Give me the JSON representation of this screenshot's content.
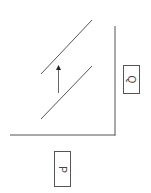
{
  "diagram": {
    "type": "shift-diagram-rotated",
    "axes": {
      "horizontal_axis": {
        "x1": 10,
        "y1": 135,
        "x2": 115,
        "y2": 135
      },
      "vertical_axis": {
        "x1": 115,
        "y1": 26,
        "x2": 115,
        "y2": 135
      }
    },
    "curves": [
      {
        "name": "upper-line",
        "x1": 41,
        "y1": 74,
        "x2": 92,
        "y2": 20
      },
      {
        "name": "lower-line",
        "x1": 41,
        "y1": 119,
        "x2": 92,
        "y2": 66
      }
    ],
    "shift_arrow": {
      "x": 58,
      "y_from": 93,
      "y_to": 66,
      "direction": "up"
    },
    "labels": {
      "q": "Q",
      "p": "P"
    },
    "colors": {
      "line": "#555555",
      "background": "#ffffff"
    }
  }
}
